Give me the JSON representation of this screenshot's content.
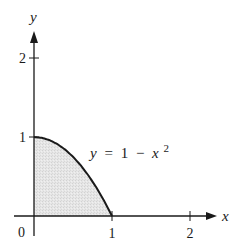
{
  "chart_data": {
    "type": "area",
    "title": "",
    "function_label": "y = 1 − x²",
    "function_label_parts": {
      "lhs": "y",
      "eq": "=",
      "const": "1",
      "minus": "−",
      "var": "x",
      "exp": "2"
    },
    "xlabel": "x",
    "ylabel": "y",
    "origin_label": "0",
    "x_ticks": [
      {
        "value": 1,
        "label": "1"
      },
      {
        "value": 2,
        "label": "2"
      }
    ],
    "y_ticks": [
      {
        "value": 1,
        "label": "1"
      },
      {
        "value": 2,
        "label": "2"
      }
    ],
    "xlim": [
      0,
      2.3
    ],
    "ylim": [
      0,
      2.3
    ],
    "grid": false,
    "legend": null,
    "series": [
      {
        "name": "y = 1 − x²",
        "x": [
          0,
          0.1,
          0.2,
          0.3,
          0.4,
          0.5,
          0.6,
          0.7,
          0.8,
          0.9,
          1.0
        ],
        "y": [
          1,
          0.99,
          0.96,
          0.91,
          0.84,
          0.75,
          0.64,
          0.51,
          0.36,
          0.19,
          0
        ]
      }
    ],
    "shaded_region": {
      "description": "Region under y = 1 − x² from x = 0 to x = 1, above the x-axis",
      "x_range": [
        0,
        1
      ],
      "fill": "#e4e4e4"
    },
    "colors": {
      "axis": "#1a1a1a",
      "curve": "#1a1a1a",
      "fill": "#e4e4e4"
    }
  }
}
